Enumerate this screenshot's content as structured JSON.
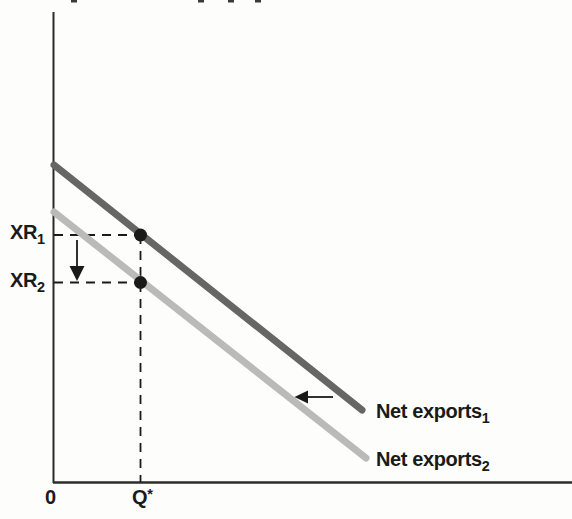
{
  "figure": {
    "background": "#fdfdfc",
    "text_color": "#1a1a1a",
    "axis_color": "#2b2b2b"
  },
  "labels": {
    "y_tick_1": {
      "base": "XR",
      "sub": "1"
    },
    "y_tick_2": {
      "base": "XR",
      "sub": "2"
    },
    "origin": "0",
    "x_tick": {
      "base": "Q",
      "sup": "*"
    },
    "curve_1": {
      "base": "Net exports",
      "sub": "1"
    },
    "curve_2": {
      "base": "Net exports",
      "sub": "2"
    }
  },
  "chart_data": {
    "type": "line",
    "title": "",
    "xlabel": "",
    "ylabel": "",
    "x_ticks": [
      "0",
      "Q*"
    ],
    "y_ticks": [
      "XR1",
      "XR2"
    ],
    "grid": false,
    "axes": {
      "y_axis": {
        "px": [
          [
            53.5,
            12
          ],
          [
            53.5,
            483
          ]
        ],
        "width": 2
      },
      "x_axis": {
        "px": [
          [
            53,
            482.5
          ],
          [
            572,
            482.5
          ]
        ],
        "width": 2.5
      }
    },
    "series": [
      {
        "name": "Net exports 1",
        "color": "#666666",
        "stroke_width": 7,
        "points_px": [
          [
            54,
            165
          ],
          [
            362,
            410
          ]
        ]
      },
      {
        "name": "Net exports 2",
        "color": "#bababa",
        "stroke_width": 7,
        "points_px": [
          [
            54,
            212
          ],
          [
            366,
            458
          ]
        ]
      }
    ],
    "guides": [
      {
        "name": "guide-vertical-qstar",
        "px": [
          [
            140.5,
            235
          ],
          [
            140.5,
            482
          ]
        ]
      },
      {
        "name": "guide-horizontal-xr1",
        "px": [
          [
            54,
            235
          ],
          [
            140,
            235
          ]
        ]
      },
      {
        "name": "guide-horizontal-xr2",
        "px": [
          [
            54,
            282.5
          ],
          [
            140,
            282.5
          ]
        ]
      }
    ],
    "markers": [
      {
        "label": "(Q*, XR1)",
        "px": [
          140.5,
          235
        ],
        "r": 6.5
      },
      {
        "label": "(Q*, XR2)",
        "px": [
          140.5,
          282.5
        ],
        "r": 6.5
      }
    ],
    "arrows": [
      {
        "name": "arrow-exchange-rate-falls",
        "meaning": "exchange rate falls from XR1 to XR2",
        "shaft_px": [
          [
            77,
            240
          ],
          [
            77,
            267
          ]
        ],
        "head_px": [
          [
            69.5,
            266
          ],
          [
            84.5,
            266
          ],
          [
            77,
            281
          ]
        ]
      },
      {
        "name": "arrow-curve-shifts-left",
        "meaning": "net exports curve shifts leftward from Net exports 1 to Net exports 2",
        "shaft_px": [
          [
            333,
            397
          ],
          [
            308,
            397
          ]
        ],
        "head_px": [
          [
            308,
            390.5
          ],
          [
            308,
            403.5
          ],
          [
            294.5,
            397
          ]
        ]
      }
    ]
  },
  "artifacts": {
    "top_mark_positions_px": [
      71,
      198,
      228,
      255
    ]
  }
}
